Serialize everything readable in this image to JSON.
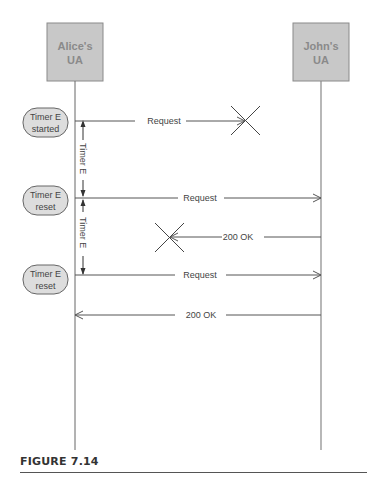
{
  "figure": {
    "caption": "FIGURE 7.14"
  },
  "participants": [
    {
      "id": "alice",
      "label_line1": "Alice's",
      "label_line2": "UA"
    },
    {
      "id": "john",
      "label_line1": "John's",
      "label_line2": "UA"
    }
  ],
  "timer_notes": [
    {
      "line1": "Timer E",
      "line2": "started"
    },
    {
      "line1": "Timer E",
      "line2": "reset"
    },
    {
      "line1": "Timer E",
      "line2": "reset"
    }
  ],
  "timer_interval_label": "Timer E",
  "messages": [
    {
      "label": "Request",
      "from": "alice",
      "to": "john",
      "lost": true
    },
    {
      "label": "Request",
      "from": "alice",
      "to": "john",
      "lost": false
    },
    {
      "label": "200 OK",
      "from": "john",
      "to": "alice",
      "lost": true
    },
    {
      "label": "Request",
      "from": "alice",
      "to": "john",
      "lost": false
    },
    {
      "label": "200 OK",
      "from": "john",
      "to": "alice",
      "lost": false
    }
  ],
  "colors": {
    "box_fill": "#c8c8c8",
    "box_stroke": "#888888",
    "box_text": "#888888",
    "line": "#555555",
    "note_fill": "#dddddd"
  }
}
